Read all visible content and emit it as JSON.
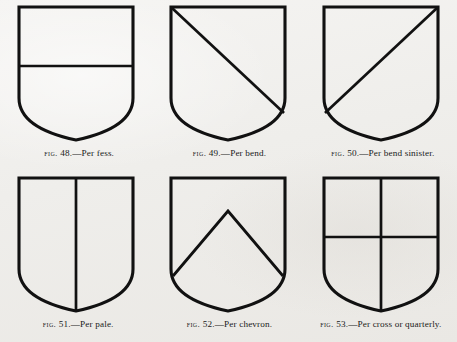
{
  "page": {
    "background_color": "#f1f0ee",
    "ink_color": "#111111",
    "plate_description": "Six heraldic shield diagrams illustrating lines of partition"
  },
  "figures": [
    {
      "number": "48",
      "fig_word": "Fig.",
      "separator": ".—",
      "name": "Per fess.",
      "caption": "Fig. 48.—Per fess.",
      "partition": "fess",
      "shield_name": "shield-per-fess"
    },
    {
      "number": "49",
      "fig_word": "Fig.",
      "separator": ".—",
      "name": "Per bend.",
      "caption": "Fig. 49.—Per bend.",
      "partition": "bend",
      "shield_name": "shield-per-bend"
    },
    {
      "number": "50",
      "fig_word": "Fig.",
      "separator": ".—",
      "name": "Per bend sinister.",
      "caption": "Fig. 50.—Per bend sinister.",
      "partition": "bend-sinister",
      "shield_name": "shield-per-bend-sinister"
    },
    {
      "number": "51",
      "fig_word": "Fig.",
      "separator": ".—",
      "name": "Per pale.",
      "caption": "Fig. 51.—Per pale.",
      "partition": "pale",
      "shield_name": "shield-per-pale"
    },
    {
      "number": "52",
      "fig_word": "Fig.",
      "separator": ".—",
      "name": "Per chevron.",
      "caption": "Fig. 52.—Per chevron.",
      "partition": "chevron",
      "shield_name": "shield-per-chevron"
    },
    {
      "number": "53",
      "fig_word": "Fig.",
      "separator": ".—",
      "name": "Per cross or quarterly.",
      "caption": "Fig. 53.—Per cross or quarterly.",
      "partition": "cross-quarterly",
      "shield_name": "shield-per-cross-or-quarterly"
    }
  ]
}
